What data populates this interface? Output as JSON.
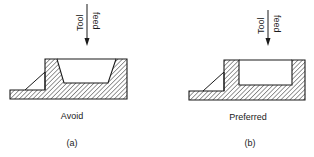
{
  "figure": {
    "panels": [
      {
        "id": "a",
        "arrow_label_line1": "Tool",
        "arrow_label_line2": "feed",
        "caption": "Avoid",
        "sublabel": "(a)",
        "cavity_shape": "tapered"
      },
      {
        "id": "b",
        "arrow_label_line1": "Tool",
        "arrow_label_line2": "feed",
        "caption": "Preferred",
        "sublabel": "(b)",
        "cavity_shape": "straight"
      }
    ],
    "colors": {
      "line": "#1a1a1a",
      "hatch": "#1a1a1a",
      "background": "#ffffff"
    }
  }
}
